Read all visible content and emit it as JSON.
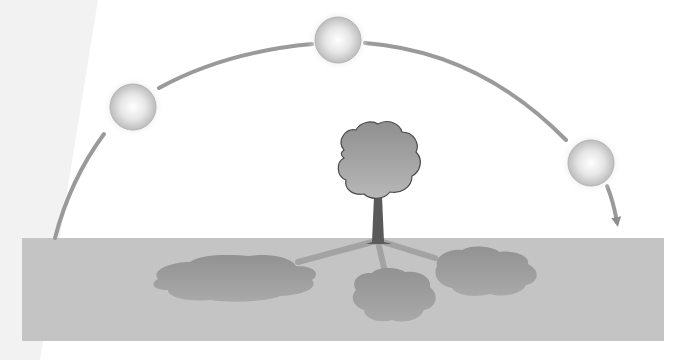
{
  "diagram": {
    "colors": {
      "background": "#ffffff",
      "left_panel": "#f3f3f3",
      "ground": "#c4c4c4",
      "arc": "#9a9a9a",
      "shadow": "#9e9e9e",
      "tree_crown": "#9c9c9c",
      "tree_trunk": "#5a5a5a"
    },
    "suns": [
      {
        "label": "morning-sun",
        "cx": 133,
        "cy": 107,
        "r": 23
      },
      {
        "label": "noon-sun",
        "cx": 338,
        "cy": 40,
        "r": 23
      },
      {
        "label": "evening-sun",
        "cx": 591,
        "cy": 163,
        "r": 23
      }
    ],
    "ground": {
      "x": 22,
      "y": 238,
      "width": 642,
      "height": 103
    },
    "tree": {
      "trunk_x": 378,
      "base_y": 240,
      "crown_cx": 378,
      "crown_cy": 160
    },
    "shadows": [
      {
        "label": "morning-shadow",
        "cx": 232,
        "cy": 277,
        "rx": 80,
        "ry": 22
      },
      {
        "label": "noon-shadow",
        "cx": 395,
        "cy": 296,
        "rx": 44,
        "ry": 26
      },
      {
        "label": "evening-shadow",
        "cx": 484,
        "cy": 271,
        "rx": 54,
        "ry": 24
      }
    ]
  }
}
